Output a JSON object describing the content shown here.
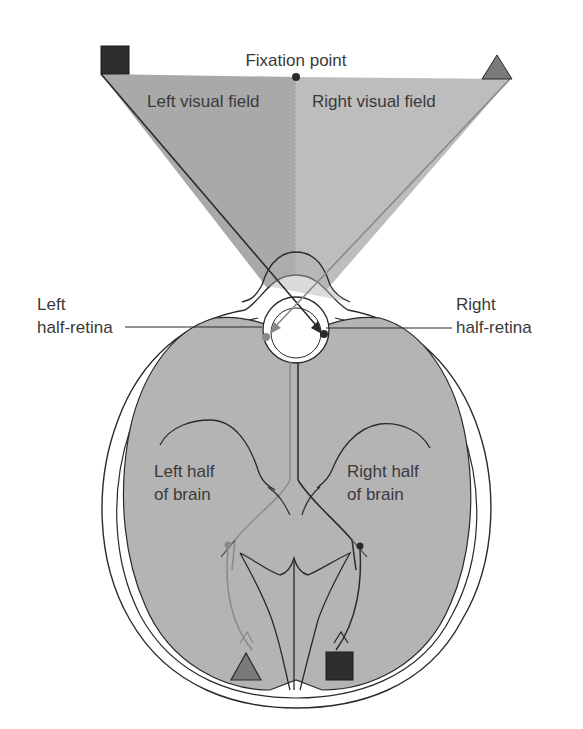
{
  "labels": {
    "fixation_point": "Fixation point",
    "left_visual_field": "Left visual field",
    "right_visual_field": "Right visual field",
    "left_half_retina_line1": "Left",
    "left_half_retina_line2": "half-retina",
    "right_half_retina_line1": "Right",
    "right_half_retina_line2": "half-retina",
    "left_brain_line1": "Left half",
    "left_brain_line2": "of brain",
    "right_brain_line1": "Right half",
    "right_brain_line2": "of brain"
  },
  "symbols": {
    "left_field_object": "square",
    "right_field_object": "triangle",
    "left_brain_representation": "triangle",
    "right_brain_representation": "square"
  },
  "colors": {
    "field_left": "#a9a9a9",
    "field_right": "#bdbdbd",
    "brain_fill": "#b4b4b4",
    "square": "#2e2e2e",
    "triangle": "#7a7a7a",
    "outline": "#2a2a2a",
    "pathway_light": "#8a8a8a",
    "pathway_dark": "#2a2a2a"
  }
}
